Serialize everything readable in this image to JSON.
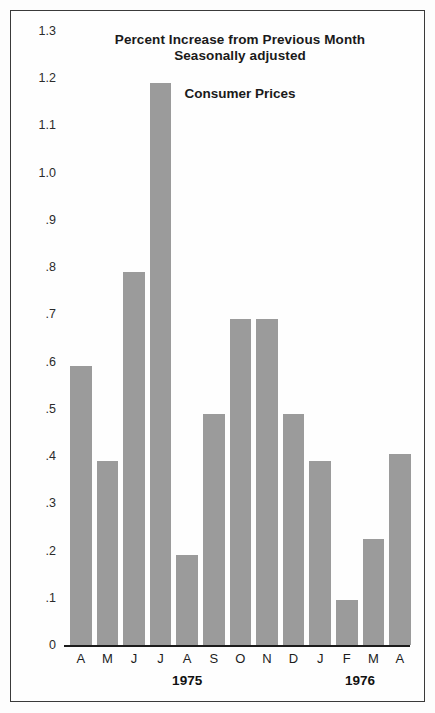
{
  "figure": {
    "title_lines": [
      "Percent Increase from Previous Month",
      "Seasonally adjusted"
    ],
    "series_label": "Consumer Prices",
    "bar_color": "#9b9b9b",
    "axis_color": "#1c1c1c",
    "frame_color": "#3a3a3a",
    "background": "#fefefe"
  },
  "chart_data": {
    "type": "bar",
    "subtitle": "Consumer Prices",
    "xlabel": "",
    "ylabel": "",
    "ylim": [
      0,
      1.3
    ],
    "grid": false,
    "legend": "none",
    "categories": [
      "A",
      "M",
      "J",
      "J",
      "A",
      "S",
      "O",
      "N",
      "D",
      "J",
      "F",
      "M",
      "A"
    ],
    "months_full": [
      "April",
      "May",
      "June",
      "July",
      "August",
      "September",
      "October",
      "November",
      "December",
      "January",
      "February",
      "March",
      "April"
    ],
    "years": [
      "1975",
      "1975",
      "1975",
      "1975",
      "1975",
      "1975",
      "1975",
      "1975",
      "1975",
      "1976",
      "1976",
      "1976",
      "1976"
    ],
    "values": [
      0.59,
      0.39,
      0.79,
      1.19,
      0.19,
      0.49,
      0.69,
      0.69,
      0.49,
      0.39,
      0.095,
      0.225,
      0.405
    ],
    "ytick_labels": [
      "1.3",
      "1.2",
      "1.1",
      "1.0",
      ".9",
      ".8",
      ".7",
      ".6",
      ".5",
      ".4",
      ".3",
      ".2",
      ".1",
      "0"
    ],
    "ytick_values": [
      1.3,
      1.2,
      1.1,
      1.0,
      0.9,
      0.8,
      0.7,
      0.6,
      0.5,
      0.4,
      0.3,
      0.2,
      0.1,
      0
    ],
    "year_groups": [
      {
        "label": "1975",
        "start_index": 0,
        "end_index": 8
      },
      {
        "label": "1976",
        "start_index": 9,
        "end_index": 12
      }
    ]
  }
}
